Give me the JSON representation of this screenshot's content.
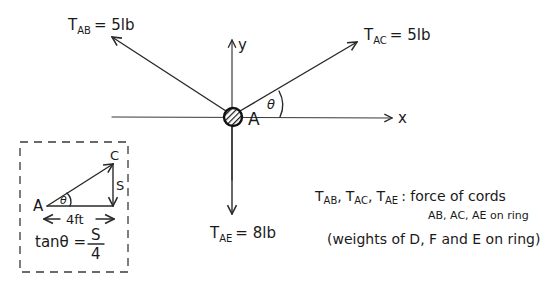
{
  "diagram": {
    "type": "free-body-diagram",
    "ring": {
      "label": "A",
      "center": [
        233,
        117
      ]
    },
    "axes": {
      "x_label": "x",
      "y_label": "y"
    },
    "angle_label": "θ",
    "forces": [
      {
        "name": "T",
        "subscript": "AB",
        "value": "= 5lb",
        "direction": "up-left"
      },
      {
        "name": "T",
        "subscript": "AC",
        "value": "= 5lb",
        "direction": "up-right at angle θ"
      },
      {
        "name": "T",
        "subscript": "AE",
        "value": "= 8lb",
        "direction": "down"
      }
    ],
    "inset": {
      "point_a": "A",
      "point_c": "C",
      "vertical_label": "S",
      "horizontal_label": "4ft",
      "angle_label": "θ",
      "equation_lhs": "tanθ =",
      "equation_num": "S",
      "equation_den": "4"
    },
    "legend": {
      "t_ab": "T",
      "t_ab_sub": "AB",
      "t_ac": "T",
      "t_ac_sub": "AC",
      "t_ae": "T",
      "t_ae_sub": "AE",
      "separator": ",",
      "line1_text": ": force of cords",
      "line2_text": "AB, AC, AE on ring",
      "line3_text": "(weights of D, F and E on ring)"
    }
  }
}
